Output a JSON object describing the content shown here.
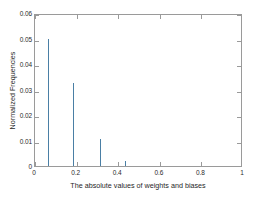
{
  "chart_data": {
    "type": "bar",
    "title": "",
    "subtitle": "",
    "xlabel": "The absolute values of weights and biases",
    "ylabel": "Normalized Frequencies",
    "xlim": [
      0,
      1
    ],
    "ylim": [
      0,
      0.06
    ],
    "xticks": [
      "0",
      "0.2",
      "0.4",
      "0.6",
      "0.8",
      "1"
    ],
    "xtick_values": [
      0,
      0.2,
      0.4,
      0.6,
      0.8,
      1
    ],
    "yticks": [
      "0",
      "0.01",
      "0.02",
      "0.03",
      "0.04",
      "0.05",
      "0.06"
    ],
    "ytick_values": [
      0,
      0.01,
      0.02,
      0.03,
      0.04,
      0.05,
      0.06
    ],
    "grid": false,
    "legend": null,
    "bar_color": "#4a7fa5",
    "bar_edge_color": "#ffffff",
    "axes_color": "#9a9a9a",
    "background": "#ffffff",
    "bin_width": 0.01,
    "x": [
      0.005,
      0.015,
      0.025,
      0.035,
      0.045,
      0.055,
      0.065,
      0.075,
      0.085,
      0.095,
      0.105,
      0.115,
      0.125,
      0.135,
      0.145,
      0.155,
      0.165,
      0.175,
      0.185,
      0.195,
      0.205,
      0.215,
      0.225,
      0.235,
      0.245,
      0.255,
      0.265,
      0.275,
      0.285,
      0.295,
      0.305,
      0.315,
      0.325,
      0.335,
      0.345,
      0.355,
      0.365,
      0.375,
      0.385,
      0.395,
      0.405,
      0.415,
      0.425,
      0.435,
      0.445,
      0.455,
      0.465,
      0.475,
      0.485,
      0.495,
      0.505,
      0.515,
      0.525,
      0.535,
      0.545,
      0.555,
      0.565,
      0.575,
      0.585,
      0.595,
      0.605,
      0.615,
      0.625,
      0.635,
      0.645,
      0.655,
      0.665,
      0.675,
      0.685,
      0.695,
      0.705,
      0.715,
      0.725,
      0.735,
      0.745,
      0.755,
      0.765,
      0.775,
      0.785,
      0.795,
      0.805,
      0.815,
      0.825,
      0.835,
      0.845,
      0.855,
      0.865,
      0.875,
      0.885,
      0.895,
      0.905,
      0.915,
      0.925,
      0.935,
      0.945,
      0.955,
      0.965,
      0.975,
      0.985,
      0.995
    ],
    "values": [
      0.055,
      0.0565,
      0.0548,
      0.0545,
      0.0528,
      0.0508,
      0.0498,
      0.0488,
      0.0478,
      0.0455,
      0.0447,
      0.043,
      0.0415,
      0.04,
      0.0382,
      0.0365,
      0.0352,
      0.034,
      0.0325,
      0.0318,
      0.0298,
      0.0278,
      0.0255,
      0.024,
      0.0222,
      0.02,
      0.0178,
      0.016,
      0.0142,
      0.0128,
      0.012,
      0.0105,
      0.0095,
      0.0082,
      0.0072,
      0.0062,
      0.0055,
      0.0048,
      0.004,
      0.0035,
      0.003,
      0.0025,
      0.0021,
      0.0018,
      0.0015,
      0.0012,
      0.001,
      0.0008,
      0.0007,
      0.0006,
      0.0005,
      0.0004,
      0.0003,
      0.0003,
      0.0002,
      0.0002,
      0.00015,
      0.00012,
      0.0001,
      0.0001,
      8e-05,
      7e-05,
      6e-05,
      5e-05,
      4e-05,
      4e-05,
      3e-05,
      3e-05,
      2e-05,
      2e-05,
      2e-05,
      1e-05,
      1e-05,
      1e-05,
      1e-05,
      1e-05,
      1e-05,
      8e-06,
      8e-06,
      6e-06,
      6e-06,
      5e-06,
      4e-06,
      4e-06,
      3e-06,
      3e-06,
      2e-06,
      2e-06,
      2e-06,
      1e-06,
      1e-06,
      1e-06,
      1e-06,
      1e-06,
      1e-06,
      5e-07,
      5e-07,
      5e-07,
      5e-07,
      5e-07
    ]
  }
}
